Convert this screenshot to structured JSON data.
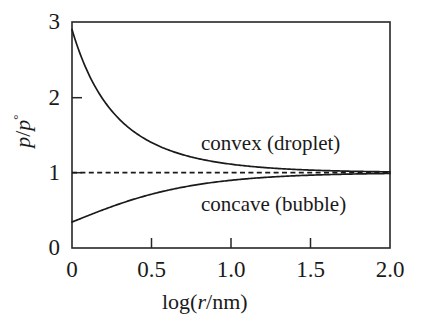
{
  "figure": {
    "name": "kelvin-equation-vapour-pressure-curvature-plot",
    "background_color": "#ffffff",
    "ink_color": "#1a1a1a"
  },
  "axes": {
    "x": {
      "label_parts": {
        "pre": "log(",
        "italic": "r",
        "post": "/nm)"
      },
      "label_plain": "log(r/nm)",
      "ticks": [
        "0",
        "0.5",
        "1.0",
        "1.5",
        "2.0"
      ],
      "tick_values": [
        0,
        0.5,
        1.0,
        1.5,
        2.0
      ],
      "range": [
        0,
        2.0
      ]
    },
    "y": {
      "label_parts": {
        "numerator": "p",
        "slash": "/",
        "denominator": "p",
        "superscript": "°"
      },
      "label_plain": "p/p°",
      "ticks": [
        "0",
        "1",
        "2",
        "3"
      ],
      "tick_values": [
        0,
        1,
        2,
        3
      ],
      "range": [
        0,
        3
      ]
    }
  },
  "annotations": [
    {
      "id": "convex",
      "text": "convex (droplet)"
    },
    {
      "id": "concave",
      "text": "concave (bubble)"
    }
  ],
  "reference_line": {
    "value": 1,
    "style": "dashed"
  },
  "chart_data": {
    "type": "line",
    "title": "",
    "xlabel": "log(r/nm)",
    "ylabel": "p/p°",
    "xlim": [
      0,
      2.0
    ],
    "ylim": [
      0,
      3
    ],
    "xticks": [
      0,
      0.5,
      1.0,
      1.5,
      2.0
    ],
    "yticks": [
      0,
      1,
      2,
      3
    ],
    "grid": false,
    "legend": "inline annotations",
    "x": [
      0,
      0.1,
      0.2,
      0.3,
      0.4,
      0.5,
      0.6,
      0.7,
      0.8,
      0.9,
      1.0,
      1.1,
      1.2,
      1.3,
      1.4,
      1.5,
      1.6,
      1.7,
      1.8,
      1.9,
      2.0
    ],
    "series": [
      {
        "name": "convex (droplet)",
        "formula": "p/p° = exp(k / 10^x), k = 1.065",
        "style": "solid",
        "values": [
          2.9,
          2.32,
          1.94,
          1.7,
          1.53,
          1.4,
          1.31,
          1.24,
          1.19,
          1.15,
          1.11,
          1.09,
          1.07,
          1.055,
          1.043,
          1.034,
          1.027,
          1.021,
          1.017,
          1.013,
          1.011
        ]
      },
      {
        "name": "concave (bubble)",
        "formula": "p/p° = exp(-k / 10^x), k = 1.065",
        "style": "solid",
        "values": [
          0.345,
          0.431,
          0.516,
          0.589,
          0.653,
          0.714,
          0.765,
          0.808,
          0.843,
          0.872,
          0.899,
          0.92,
          0.936,
          0.948,
          0.959,
          0.967,
          0.974,
          0.979,
          0.983,
          0.987,
          0.989
        ]
      },
      {
        "name": "reference",
        "formula": "p/p° = 1",
        "style": "dashed",
        "values": [
          1,
          1,
          1,
          1,
          1,
          1,
          1,
          1,
          1,
          1,
          1,
          1,
          1,
          1,
          1,
          1,
          1,
          1,
          1,
          1,
          1
        ]
      }
    ]
  }
}
